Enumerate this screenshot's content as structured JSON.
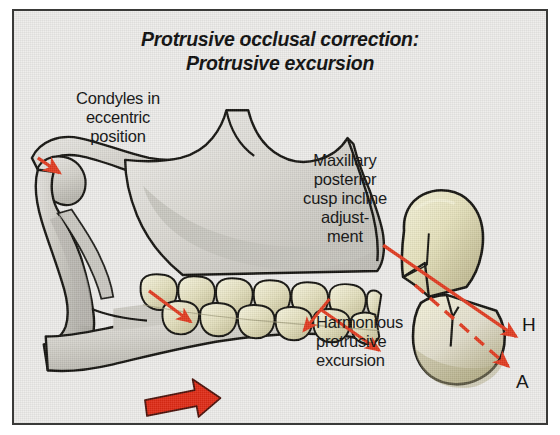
{
  "figure": {
    "domain_type": "anatomical-illustration",
    "title_lines": [
      "Protrusive occlusal correction:",
      "Protrusive excursion"
    ],
    "background_color": "#edecea",
    "border_color": "#3a3a38",
    "page_color": "#ffffff"
  },
  "labels": {
    "condyles": "Condyles in\neccentric\nposition",
    "maxillary": "Maxillary\nposterior\ncusp incline\nadjust-\nment",
    "harmonious": "Harmonious\nprotrusive\nexcursion"
  },
  "axis_letters": {
    "h": "H",
    "a": "A"
  },
  "colors": {
    "arrow_red": "#e23b20",
    "block_arrow_red": "#e02a15",
    "bone_light": "#e9e8e4",
    "bone_mid": "#cfcdc7",
    "bone_shadow": "#b3b1aa",
    "tooth_light": "#f2f0d8",
    "tooth_mid": "#ddd9b4",
    "tooth_shadow": "#bdb894",
    "outline": "#14130f"
  },
  "annotations": {
    "solid_arrow_label": "H",
    "dashed_arrow_label": "A",
    "condyle_arrow": "condyle eccentric direction",
    "teeth_arrows": "protrusive glide direction",
    "block_arrow": "mandibular protrusion direction"
  }
}
